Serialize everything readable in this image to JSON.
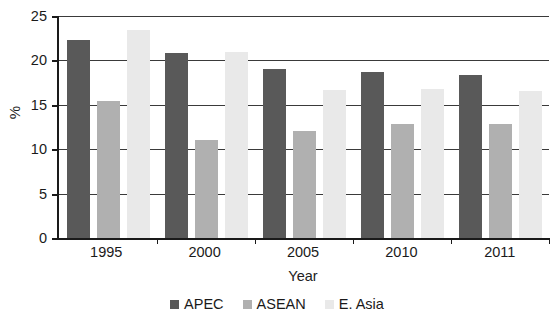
{
  "chart_data": {
    "type": "bar",
    "title": "",
    "xlabel": "Year",
    "ylabel": "%",
    "categories": [
      "1995",
      "2000",
      "2005",
      "2010",
      "2011"
    ],
    "series": [
      {
        "name": "APEC",
        "color": "#595959",
        "values": [
          22.3,
          20.8,
          19.0,
          18.7,
          18.4
        ]
      },
      {
        "name": "ASEAN",
        "color": "#b0b0b0",
        "values": [
          15.4,
          11.0,
          12.1,
          12.8,
          12.8
        ]
      },
      {
        "name": "E. Asia",
        "color": "#e9e9e9",
        "values": [
          23.4,
          20.9,
          16.7,
          16.8,
          16.6
        ]
      }
    ],
    "ylim": [
      0,
      25
    ],
    "yticks": [
      0,
      5,
      10,
      15,
      20,
      25
    ],
    "ytick_labels": [
      "0",
      "5",
      "10",
      "15",
      "20",
      "25"
    ],
    "grid": true,
    "legend_position": "bottom"
  }
}
